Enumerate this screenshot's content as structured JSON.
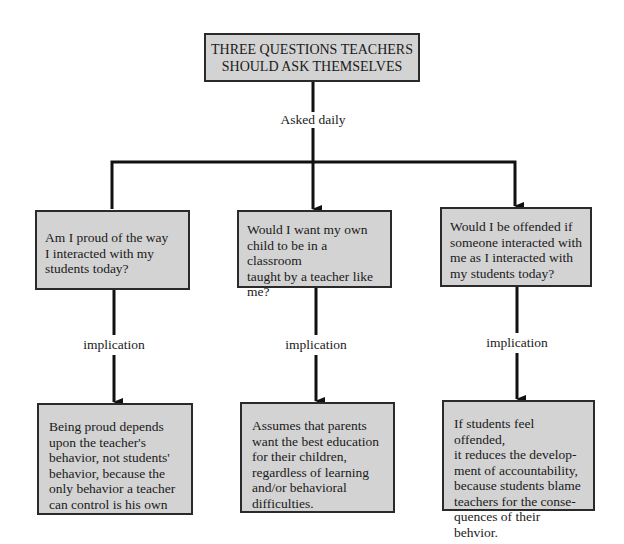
{
  "title": "THREE QUESTIONS TEACHERS SHOULD ASK THEMSELVES",
  "title_lines": [
    "THREE QUESTIONS TEACHERS",
    "SHOULD ASK THEMSELVES"
  ],
  "connector_label": "Asked daily",
  "questions": [
    {
      "lines": [
        "Am I proud of the way",
        "I interacted with my",
        "students today?"
      ]
    },
    {
      "lines": [
        "Would I want my own",
        "child to be in a classroom",
        "taught by a teacher like",
        "me?"
      ]
    },
    {
      "lines": [
        "Would I be offended if",
        "someone interacted with",
        "me as I interacted with",
        "my students today?"
      ]
    }
  ],
  "implication_label": "implication",
  "implications": [
    {
      "lines": [
        "Being proud depends",
        "upon the teacher's",
        "behavior, not students'",
        "behavior, because the",
        "only behavior a teacher",
        "can control is his own"
      ]
    },
    {
      "lines": [
        "Assumes that parents",
        "want the best education",
        "for their children,",
        "regardless of learning",
        "and/or behavioral",
        "difficulties."
      ]
    },
    {
      "lines": [
        "If students feel offended,",
        "it reduces the develop-",
        "ment of accountability,",
        "because students blame",
        "teachers for the conse-",
        "quences of their behvior."
      ]
    }
  ],
  "colors": {
    "box_fill": "#d3d3d3",
    "line": "#111111",
    "border": "#2a2a2a"
  }
}
